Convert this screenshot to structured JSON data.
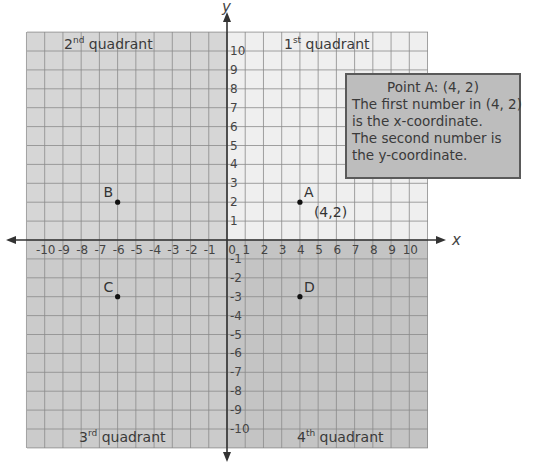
{
  "axes": {
    "x_label": "x",
    "y_label": "y",
    "x_ticks": [
      "-10",
      "-9",
      "-8",
      "-7",
      "-6",
      "-5",
      "-4",
      "-3",
      "-2",
      "-1",
      "0",
      "1",
      "2",
      "3",
      "4",
      "5",
      "6",
      "7",
      "8",
      "9",
      "10"
    ],
    "y_ticks": [
      "10",
      "9",
      "8",
      "7",
      "6",
      "5",
      "4",
      "3",
      "2",
      "1",
      "-1",
      "-2",
      "-3",
      "-4",
      "-5",
      "-6",
      "-7",
      "-8",
      "-9",
      "-10"
    ],
    "range": [
      -11,
      11
    ]
  },
  "quadrants": {
    "q1": {
      "num": "1",
      "sup": "st",
      "word": "quadrant"
    },
    "q2": {
      "num": "2",
      "sup": "nd",
      "word": "quadrant"
    },
    "q3": {
      "num": "3",
      "sup": "rd",
      "word": "quadrant"
    },
    "q4": {
      "num": "4",
      "sup": "th",
      "word": "quadrant"
    }
  },
  "points": [
    {
      "name": "A",
      "x": 4,
      "y": 2,
      "coord_label": "(4,2)"
    },
    {
      "name": "B",
      "x": -6,
      "y": 2
    },
    {
      "name": "C",
      "x": -6,
      "y": -3
    },
    {
      "name": "D",
      "x": 4,
      "y": -3
    }
  ],
  "info_box": {
    "title": "Point A: (4, 2)",
    "lines": [
      "The first number in (4, 2)",
      "is the x-coordinate.",
      "The second number is",
      "the y-coordinate."
    ]
  },
  "colors": {
    "q1_fill": "#efefef",
    "q2_fill": "#d6d6d6",
    "q3_fill": "#cbcbcb",
    "q4_fill": "#c4c4c4",
    "grid": "#8a8a8a",
    "axis": "#333333",
    "info_fill": "#bdbdbd"
  }
}
